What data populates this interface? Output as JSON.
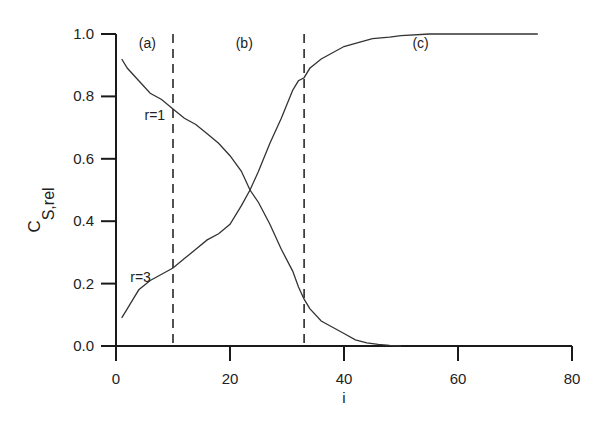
{
  "chart_data": {
    "type": "line",
    "title": "",
    "xlabel": "i",
    "ylabel": "C_S,rel",
    "ylabel_main": "C",
    "ylabel_sub": "S,rel",
    "xlim": [
      0,
      80
    ],
    "ylim": [
      0,
      1.0
    ],
    "xticks": [
      0,
      20,
      40,
      60,
      80
    ],
    "yticks": [
      0.0,
      0.2,
      0.4,
      0.6,
      0.8,
      1.0
    ],
    "xtick_labels": [
      "0",
      "20",
      "40",
      "60",
      "80"
    ],
    "ytick_labels": [
      "0.0",
      "0.2",
      "0.4",
      "0.6",
      "0.8",
      "1.0"
    ],
    "grid": false,
    "legend": "none (inline labels)",
    "vlines": [
      {
        "x": 10,
        "style": "dashed"
      },
      {
        "x": 33,
        "style": "dashed"
      }
    ],
    "region_labels": [
      {
        "text": "(a)",
        "x": 4,
        "y": 0.98
      },
      {
        "text": "(b)",
        "x": 21,
        "y": 0.98
      },
      {
        "text": "(c)",
        "x": 52,
        "y": 0.98
      }
    ],
    "series": [
      {
        "name": "r=1",
        "label_pos": {
          "x": 5,
          "y": 0.74
        },
        "x": [
          1,
          2,
          4,
          6,
          8,
          10,
          12,
          14,
          16,
          18,
          20,
          22,
          23.5,
          25,
          27,
          29,
          31,
          32,
          33,
          34,
          36,
          38,
          40,
          42,
          44,
          46,
          48,
          50
        ],
        "y": [
          0.92,
          0.89,
          0.85,
          0.81,
          0.79,
          0.76,
          0.73,
          0.71,
          0.68,
          0.65,
          0.61,
          0.56,
          0.5,
          0.46,
          0.39,
          0.31,
          0.24,
          0.19,
          0.15,
          0.12,
          0.08,
          0.06,
          0.04,
          0.02,
          0.01,
          0.005,
          0.002,
          0.0
        ]
      },
      {
        "name": "r=3",
        "label_pos": {
          "x": 2.5,
          "y": 0.22
        },
        "x": [
          1,
          2,
          3,
          4,
          6,
          8,
          10,
          12,
          14,
          16,
          18,
          20,
          22,
          23.5,
          25,
          27,
          29,
          31,
          32,
          33,
          34,
          36,
          38,
          40,
          42,
          45,
          48,
          50,
          55,
          60,
          65,
          70,
          74
        ],
        "y": [
          0.09,
          0.12,
          0.15,
          0.18,
          0.21,
          0.23,
          0.25,
          0.28,
          0.31,
          0.34,
          0.36,
          0.39,
          0.45,
          0.5,
          0.56,
          0.65,
          0.73,
          0.82,
          0.85,
          0.86,
          0.89,
          0.92,
          0.94,
          0.96,
          0.97,
          0.985,
          0.99,
          0.995,
          1.0,
          1.0,
          1.0,
          1.0,
          1.0
        ]
      }
    ]
  }
}
